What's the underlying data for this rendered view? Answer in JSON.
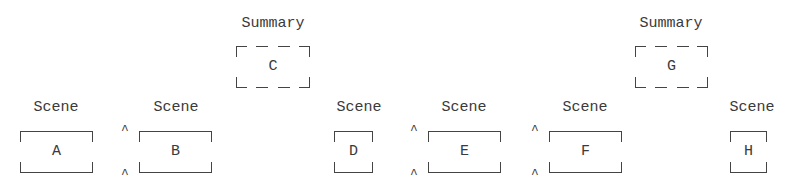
{
  "diagram": {
    "nodes": [
      {
        "id": "A",
        "label": "Scene",
        "type": "scene",
        "markers": false
      },
      {
        "id": "B",
        "label": "Scene",
        "type": "scene",
        "markers": true
      },
      {
        "id": "C",
        "label": "Summary",
        "type": "summary",
        "markers": false
      },
      {
        "id": "D",
        "label": "Scene",
        "type": "scene",
        "markers": false
      },
      {
        "id": "E",
        "label": "Scene",
        "type": "scene",
        "markers": true
      },
      {
        "id": "F",
        "label": "Scene",
        "type": "scene",
        "markers": true
      },
      {
        "id": "G",
        "label": "Summary",
        "type": "summary",
        "markers": false
      },
      {
        "id": "H",
        "label": "Scene",
        "type": "scene",
        "markers": false
      }
    ],
    "marker_glyph": "^",
    "colors": {
      "line": "#444444",
      "text": "#3a3a3a",
      "background": "#ffffff"
    }
  }
}
